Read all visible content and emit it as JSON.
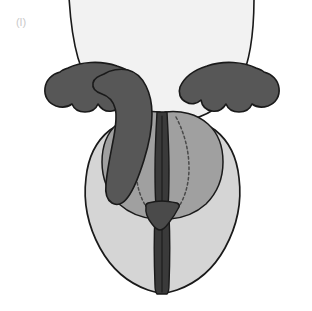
{
  "figure": {
    "panel_label": "(l)",
    "label_color": "#c9c9c9",
    "background": "#ffffff",
    "width": 312,
    "height": 311,
    "view": "posterior coronal section",
    "stroke_color": "#1a1a1a"
  },
  "palette": {
    "white_dome": "#f2f2f2",
    "light_gray": "#d5d5d5",
    "medium_gray": "#a0a0a0",
    "dark_gray": "#575757",
    "outline": "#1a1a1a",
    "dashed_line": "#4a4a4a"
  },
  "regions": [
    {
      "id": "superior-dome",
      "name": "superior dome",
      "fill": "#f2f2f2",
      "description": "large near-white rounded mass occupying the upper portion, cropped by the top edge of the frame"
    },
    {
      "id": "left-scalloped-lobe",
      "name": "left scalloped lobe",
      "fill": "#575757",
      "description": "dark gray elongated lobe with scalloped inferior margin on the left flank"
    },
    {
      "id": "right-scalloped-lobe",
      "name": "right scalloped lobe",
      "fill": "#575757",
      "description": "dark gray elongated lobe with scalloped inferior margin on the right flank"
    },
    {
      "id": "central-dark-mass",
      "name": "central dark mass",
      "fill": "#575757",
      "description": "irregular dark gray mass overlapping left of midline, descending from the dome to mid-figure"
    },
    {
      "id": "left-medium-wing",
      "name": "left medium wing",
      "fill": "#a0a0a0",
      "description": "medium gray wing-shaped region left of midline bearing a dashed interior contour"
    },
    {
      "id": "right-medium-wing",
      "name": "right medium wing",
      "fill": "#a0a0a0",
      "description": "medium gray wing-shaped region right of midline bearing a dashed interior contour"
    },
    {
      "id": "left-inferior-lobe",
      "name": "left inferior lobe",
      "fill": "#d5d5d5",
      "description": "large light gray rounded lobe forming the lower-left of the figure"
    },
    {
      "id": "right-inferior-lobe",
      "name": "right inferior lobe",
      "fill": "#d5d5d5",
      "description": "large light gray rounded lobe forming the lower-right of the figure"
    },
    {
      "id": "midline-stem",
      "name": "midline stem",
      "fill": "#3a3a3a",
      "description": "dark vertical stem running down the midline to the inferior border"
    },
    {
      "id": "stem-flare",
      "name": "stem triangular flare",
      "fill": "#4a4a4a",
      "description": "dark triangular widening of the stem at mid-inferior level"
    }
  ],
  "annotations": [
    {
      "id": "left-dashed-contour",
      "name": "left dashed contour",
      "style": "dashed",
      "color": "#4a4a4a"
    },
    {
      "id": "right-dashed-contour",
      "name": "right dashed contour",
      "style": "dashed",
      "color": "#4a4a4a"
    }
  ]
}
